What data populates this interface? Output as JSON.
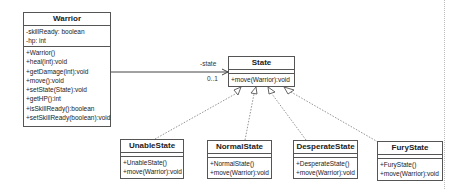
{
  "diagram": {
    "type": "UML class diagram (State pattern)",
    "classes": {
      "warrior": {
        "name": "Warrior",
        "attributes": [
          "-skillReady: boolean",
          "-hp: int"
        ],
        "operations": [
          "+Warrior()",
          "+heal(int):void",
          "+getDamage(int):void",
          "+move():void",
          "+setState(State):void",
          "+getHP():int",
          "+isSkillReady():boolean",
          "+setSkillReady(boolean):void"
        ]
      },
      "state": {
        "name": "State",
        "attributes": [],
        "operations": [
          "+move(Warrior):void"
        ]
      },
      "unable": {
        "name": "UnableState",
        "operations": [
          "+UnableState()",
          "+move(Warrior):void"
        ]
      },
      "normal": {
        "name": "NormalState",
        "operations": [
          "+NormalState()",
          "+move(Warrior):void"
        ]
      },
      "desperate": {
        "name": "DesperateState",
        "operations": [
          "+DesperateState()",
          "+move(Warrior):void"
        ]
      },
      "fury": {
        "name": "FuryState",
        "operations": [
          "+FuryState()",
          "+move(Warrior):void"
        ]
      }
    },
    "association": {
      "from": "Warrior",
      "to": "State",
      "role": "-state",
      "multiplicity": "0..1"
    },
    "realizations": [
      {
        "from": "UnableState",
        "to": "State"
      },
      {
        "from": "NormalState",
        "to": "State"
      },
      {
        "from": "DesperateState",
        "to": "State"
      },
      {
        "from": "FuryState",
        "to": "State"
      }
    ]
  }
}
